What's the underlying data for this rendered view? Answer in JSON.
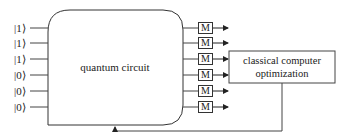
{
  "diagram": {
    "input_states": [
      "|1⟩",
      "|1⟩",
      "|1⟩",
      "|0⟩",
      "|0⟩",
      "|0⟩"
    ],
    "quantum_block_label": "quantum circuit",
    "measurement_label": "M",
    "measurements": [
      "M",
      "M",
      "M",
      "M",
      "M",
      "M"
    ],
    "classical_block_label_line1": "classical computer",
    "classical_block_label_line2": "optimization",
    "colors": {
      "stroke": "#333333",
      "text": "#222222",
      "background": "#ffffff"
    }
  }
}
